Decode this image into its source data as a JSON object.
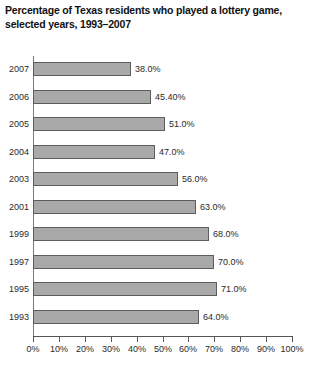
{
  "chart_data": {
    "type": "bar",
    "orientation": "horizontal",
    "title": "Percentage of Texas residents who played a lottery game, selected years, 1993–2007",
    "title_lines": [
      "Percentage of Texas residents who played a lottery game,",
      "selected years, 1993–2007"
    ],
    "xlabel": "",
    "ylabel": "",
    "categories": [
      "2007",
      "2006",
      "2005",
      "2004",
      "2003",
      "2001",
      "1999",
      "1997",
      "1995",
      "1993"
    ],
    "values": [
      38.0,
      45.4,
      51.0,
      47.0,
      56.0,
      63.0,
      68.0,
      70.0,
      71.0,
      64.0
    ],
    "value_labels": [
      "38.0%",
      "45.40%",
      "51.0%",
      "47.0%",
      "56.0%",
      "63.0%",
      "68.0%",
      "70.0%",
      "71.0%",
      "64.0%"
    ],
    "xlim": [
      0,
      100
    ],
    "xticks": [
      0,
      10,
      20,
      30,
      40,
      50,
      60,
      70,
      80,
      90,
      100
    ],
    "xtick_labels": [
      "0%",
      "10%",
      "20%",
      "30%",
      "40%",
      "50%",
      "60%",
      "70%",
      "80%",
      "90%",
      "100%"
    ],
    "grid": false,
    "legend": false,
    "bar_color": "#a9a9a9",
    "bar_border_color": "#5d5d5d",
    "axis_color": "#555555",
    "background": "#ffffff",
    "bars": [
      {
        "category": "2007",
        "value": 38.0,
        "label": "38.0%"
      },
      {
        "category": "2006",
        "value": 45.4,
        "label": "45.40%"
      },
      {
        "category": "2005",
        "value": 51.0,
        "label": "51.0%"
      },
      {
        "category": "2004",
        "value": 47.0,
        "label": "47.0%"
      },
      {
        "category": "2003",
        "value": 56.0,
        "label": "56.0%"
      },
      {
        "category": "2001",
        "value": 63.0,
        "label": "63.0%"
      },
      {
        "category": "1999",
        "value": 68.0,
        "label": "68.0%"
      },
      {
        "category": "1997",
        "value": 70.0,
        "label": "70.0%"
      },
      {
        "category": "1995",
        "value": 71.0,
        "label": "71.0%"
      },
      {
        "category": "1993",
        "value": 64.0,
        "label": "64.0%"
      }
    ]
  }
}
